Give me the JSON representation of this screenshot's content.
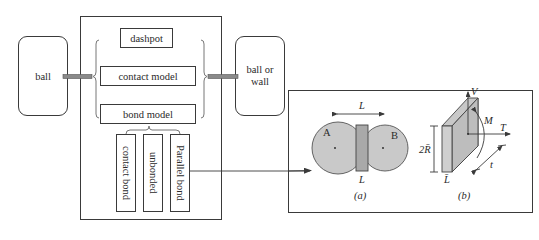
{
  "diagram": {
    "left_node": {
      "label": "ball"
    },
    "right_node": {
      "label_line1": "ball or",
      "label_line2": "wall"
    },
    "contact_components": {
      "dashpot": "dashpot",
      "contact_model": "contact model",
      "bond_model": "bond model"
    },
    "bond_types": [
      {
        "label": "contact bond"
      },
      {
        "label": "unbonded"
      },
      {
        "label": "Parallel bond"
      }
    ],
    "detail_panel": {
      "subfigure_a": {
        "caption": "(a)",
        "ball_a": "A",
        "ball_b": "B",
        "length_top": "L",
        "length_bottom": "L"
      },
      "subfigure_b": {
        "caption": "(b)",
        "height": "2R̄",
        "thickness": "L̄",
        "shear_force": "V",
        "moment": "M",
        "tension": "T",
        "extent": "t"
      }
    },
    "colors": {
      "line": "#3a3a3a",
      "ball_fill": "#c9c9c9",
      "bar_fill": "#a9a9a9",
      "connector": "#8a8a8a"
    }
  }
}
